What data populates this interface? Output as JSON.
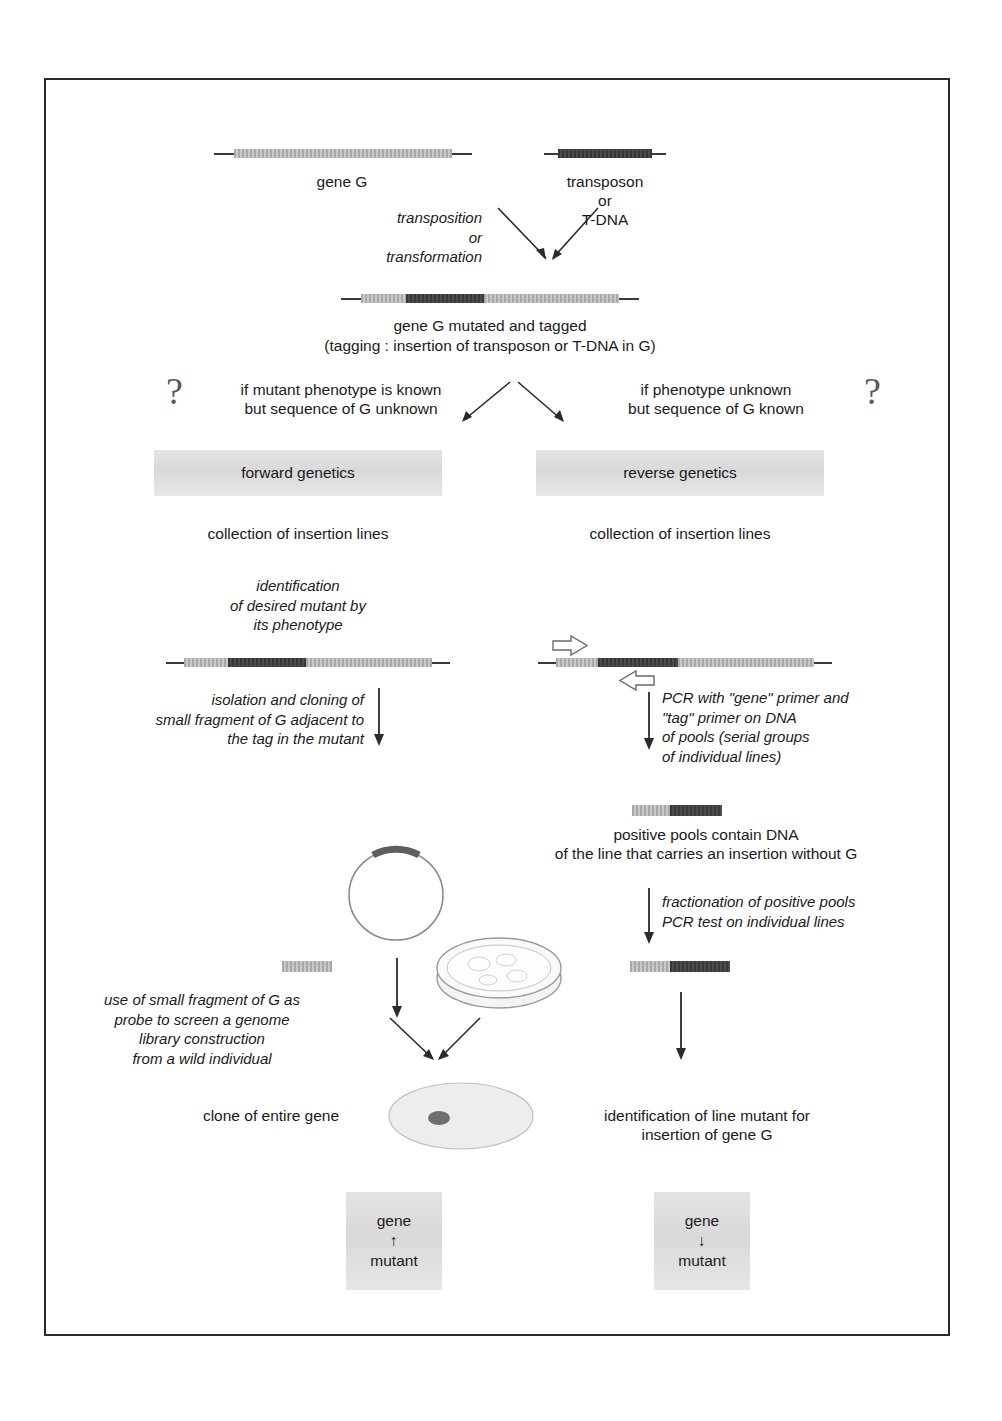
{
  "figure": {
    "border_color": "#2b2b2b",
    "background": "#ffffff"
  },
  "colors": {
    "gene_light": "#b9b9b9",
    "tag_dark": "#3c3c3c",
    "box_grey": "#dcdcdc",
    "line": "#2b2b2b",
    "question_mark": "#5a5a5a"
  },
  "top": {
    "gene_label": "gene G",
    "transposon_label": "transposon\nor\nT-DNA",
    "process_label": "transposition\nor\ntransformation"
  },
  "mutated": {
    "caption_line1": "gene G mutated and tagged",
    "caption_line2": "(tagging : insertion of transposon or T-DNA in G)"
  },
  "branch": {
    "left_question": "?",
    "right_question": "?",
    "left_condition": "if mutant phenotype is known\nbut sequence of G unknown",
    "right_condition": "if phenotype unknown\nbut sequence of G known"
  },
  "left_column": {
    "banner": "forward genetics",
    "collection": "collection of insertion lines",
    "identification": "identification\nof desired mutant by\nits phenotype",
    "isolation": "isolation and cloning of\nsmall fragment of G adjacent to\nthe tag in the mutant",
    "probe": "use of small fragment of G as\nprobe to screen a genome\nlibrary construction\nfrom a wild individual",
    "clone": "clone of entire gene",
    "result_box": "gene\n↑\nmutant"
  },
  "right_column": {
    "banner": "reverse genetics",
    "collection": "collection of insertion lines",
    "pcr": "PCR with \"gene\" primer and\n\"tag\" primer on DNA\nof pools (serial groups\nof individual lines)",
    "positive_pools": "positive pools contain DNA\nof the line that carries an insertion without G",
    "fractionation": "fractionation of positive pools\nPCR test on individual lines",
    "identification": "identification of line mutant for\ninsertion of gene G",
    "result_box": "gene\n↓\nmutant"
  },
  "icons": {
    "plasmid": "plasmid-circle-icon",
    "petri": "petri-dish-icon",
    "clone_ellipse": "genomic-clone-ellipse-icon",
    "primer_forward": "forward-primer-arrow-icon",
    "primer_reverse": "reverse-primer-arrow-icon"
  }
}
